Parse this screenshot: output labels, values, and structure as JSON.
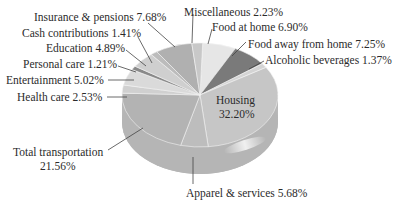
{
  "chart_data": {
    "type": "pie",
    "style": "3d-tilted",
    "title": "",
    "unit": "%",
    "categories": [
      "Food at home",
      "Food away from home",
      "Alcoholic beverages",
      "Housing",
      "Apparel & services",
      "Total transportation",
      "Health care",
      "Entertainment",
      "Personal care",
      "Education",
      "Cash contributions",
      "Insurance & pensions",
      "Miscellaneous"
    ],
    "values": [
      6.9,
      7.25,
      1.37,
      32.2,
      5.68,
      21.56,
      2.53,
      5.02,
      1.21,
      4.89,
      1.41,
      7.68,
      2.23
    ],
    "colors": [
      "#e6e6e6",
      "#7a7a7a",
      "#d4d4d4",
      "#c6c6c6",
      "#bdbdbd",
      "#b3b3b3",
      "#d0d0d0",
      "#dadada",
      "#8a8a8a",
      "#cfcfcf",
      "#bcbcbc",
      "#b0b0b0",
      "#c8c8c8"
    ],
    "legend": "none (callout labels)"
  },
  "labels": {
    "insurance": "Insurance & pensions 7.68%",
    "cash": "Cash contributions 1.41%",
    "education": "Education 4.89%",
    "personal": "Personal care 1.21%",
    "entertainment": "Entertainment 5.02%",
    "health": "Health care 2.53%",
    "transport_name": "Total transportation",
    "transport_value": "21.56%",
    "misc": "Miscellaneous 2.23%",
    "food_home": "Food at home 6.90%",
    "food_away": "Food away from home 7.25%",
    "alcohol": "Alcoholic beverages 1.37%",
    "housing_name": "Housing",
    "housing_value": "32.20%",
    "apparel": "Apparel & services 5.68%"
  }
}
